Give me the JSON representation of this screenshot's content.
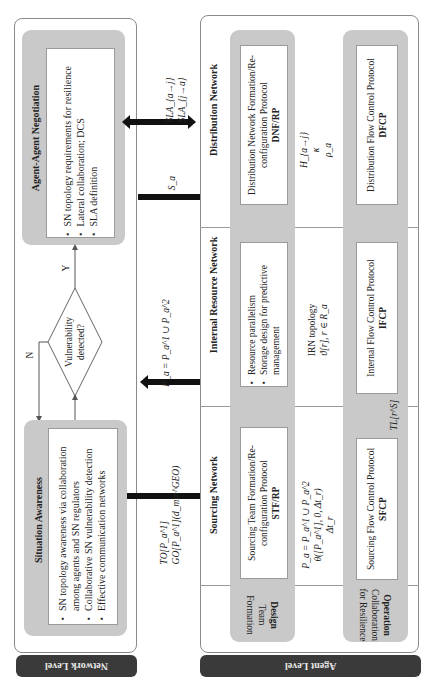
{
  "network_level": {
    "tab_label": "Network Level",
    "agent_negotiation": {
      "title": "Agent-Agent Negotiation",
      "bullets": [
        "SN topology requirements for resilience",
        "Lateral collaboration; DCS",
        "SLA definition"
      ]
    },
    "decision": {
      "question_line1": "Vulnerability",
      "question_line2": "detected?",
      "yes_label": "Y",
      "no_label": "N"
    },
    "situation_awareness": {
      "title": "Situation Awareness",
      "bullets": [
        "SN topology awareness via collaboration among agents and SN regulators",
        "Collaborative SN vulnerability detection",
        "Effective communication networks"
      ],
      "bullet1_line1": "SN topology awareness via collaboration",
      "bullet1_line2": "among agents and SN regulators"
    }
  },
  "interlevel_arrows": {
    "sla_line1": "SLA_{a→j}",
    "sla_line2": "SLA_{j→a}",
    "s_a": "S_a",
    "p_a": "P_a = P_a^1 ∪ P_a^2",
    "to_line1": "TO[P_a^1]",
    "to_line2": "GO[P_a^1](d_min^GEO)"
  },
  "agent_level": {
    "tab_label": "Agent Level",
    "networks": {
      "distribution": "Distribution Network",
      "internal_resource": "Internal Resource Network",
      "sourcing": "Sourcing Network"
    },
    "design_row": {
      "label_line1": "Design",
      "label_line2": "Team",
      "label_line3": "Formation",
      "dnf": {
        "line1": "Distribution Network Formation/Re-",
        "line2": "configuration Protocol",
        "acronym": "DNF/RP"
      },
      "irn": {
        "bullets": [
          "Resource parallelism",
          "Storage design for predictive management"
        ],
        "bullet2_line1": "Storage design for predictive",
        "bullet2_line2": "management"
      },
      "stf": {
        "line1": "Sourcing Team Formation/Re-",
        "line2": "configuration Protocol",
        "acronym": "STF/RP"
      }
    },
    "operation_row": {
      "label_line1": "Operation",
      "label_line2": "Collaboration",
      "label_line3": "for Resilience",
      "dfcp": {
        "line1": "Distribution Flow Control Protocol",
        "acronym": "DFCP"
      },
      "ifcp": {
        "line1": "Internal Flow Control Protocol",
        "acronym": "IFCP"
      },
      "sfcp": {
        "line1": "Sourcing Flow Control Protocol",
        "acronym": "SFCP"
      }
    },
    "link_labels": {
      "dist_line1": "H_{a→j}",
      "dist_line2": "κ",
      "dist_line3": "ρ_a",
      "irn_line1": "IRN topology",
      "irn_line2": "ϑ[r], r ∈ R_a",
      "src_line1": "P_a = P_a^1 ∪ P_a^2",
      "src_line2": "θ([P_a^1], 0, Δt_r)",
      "src_line3": "Δt_r",
      "tl": "TL[r^S]"
    }
  }
}
